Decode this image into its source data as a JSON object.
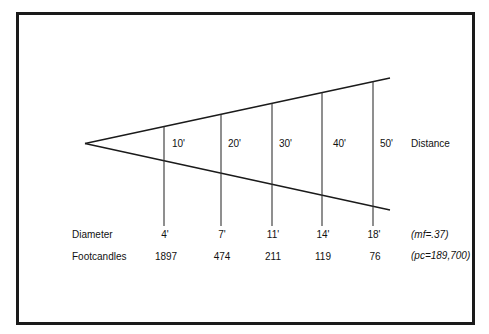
{
  "diagram": {
    "title": "",
    "distance_label": "Distance",
    "diameter_label": "Diameter",
    "footcandles_label": "Footcandles",
    "mf_note": "(mf=.37)",
    "pc_note": "(pc=189,700)",
    "columns": [
      {
        "distance": "10'",
        "diameter": "4'",
        "footcandles": "1897"
      },
      {
        "distance": "20'",
        "diameter": "7'",
        "footcandles": "474"
      },
      {
        "distance": "30'",
        "diameter": "11'",
        "footcandles": "211"
      },
      {
        "distance": "40'",
        "diameter": "14'",
        "footcandles": "119"
      },
      {
        "distance": "50'",
        "diameter": "18'",
        "footcandles": "76"
      }
    ]
  },
  "colors": {
    "line": "#1a1a1a",
    "background": "#ffffff"
  }
}
